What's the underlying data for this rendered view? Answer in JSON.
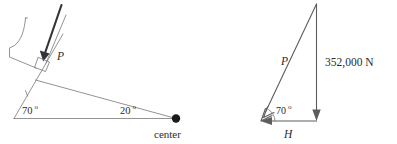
{
  "figure": {
    "background_color": "#ffffff",
    "width": 397,
    "height": 144
  },
  "left_diagram": {
    "name": "plan-view-arch-segment",
    "description": "Plan view of an arch dam segment with radial thrust P acting perpendicular to the abutment face, radius lines meeting at the arch center",
    "labels": {
      "force_P": "P",
      "abutment_angle": "70",
      "half_central_angle": "20",
      "degree_symbol": "o",
      "center_label": "center"
    },
    "geometry": {
      "baseline_start": [
        14,
        118
      ],
      "baseline_end": [
        176,
        118
      ],
      "center_point": [
        176,
        118
      ],
      "abutment_line_start": [
        14,
        118
      ],
      "abutment_line_end": [
        62,
        36
      ],
      "radius_line_start": [
        38,
        74
      ],
      "radius_line_end": [
        176,
        118
      ],
      "thrust_arrow_start": [
        60,
        5
      ],
      "thrust_arrow_end": [
        43,
        59
      ],
      "right_angle_marker": [
        44,
        61
      ]
    },
    "colors": {
      "line": "#777777",
      "thrust_arrow": "#33333a",
      "center_dot": "#1a1a1a",
      "text": "#2b2b2b"
    }
  },
  "right_diagram": {
    "name": "force-triangle",
    "description": "Force triangle resolving the vertical load into thrust P along the arch and horizontal reaction H at 70 degrees",
    "labels": {
      "force_P": "P",
      "angle": "70",
      "degree_symbol": "o",
      "horizontal_force_H": "H",
      "vertical_force_value": "352,000 N"
    },
    "geometry": {
      "apex": [
        316,
        4
      ],
      "bottom_left": [
        261,
        121
      ],
      "bottom_right": [
        316,
        121
      ],
      "vertical_arrow_start": [
        316,
        4
      ],
      "vertical_arrow_end": [
        316,
        121
      ],
      "hypotenuse_arrow_start": [
        316,
        4
      ],
      "hypotenuse_arrow_end": [
        261,
        121
      ],
      "horizontal_arrow_start": [
        316,
        121
      ],
      "horizontal_arrow_end": [
        261,
        121
      ]
    },
    "colors": {
      "line": "#5d5d5d",
      "text": "#2b2b2b"
    }
  }
}
